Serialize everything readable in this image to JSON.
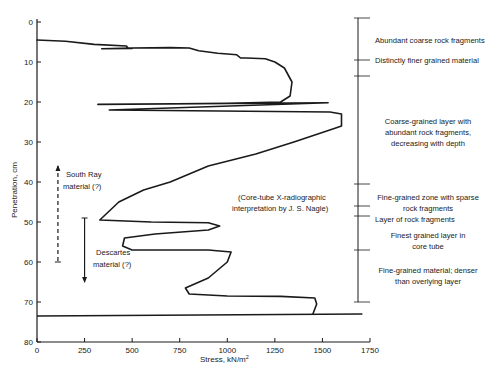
{
  "chart_data": {
    "type": "line",
    "title": "",
    "xlabel": "Stress, kN/m²",
    "ylabel": "Penetration, cm",
    "xlim": [
      0,
      1750
    ],
    "ylim": [
      80,
      0
    ],
    "y_inverted": true,
    "grid": false,
    "x_ticks": [
      0,
      250,
      500,
      750,
      1000,
      1250,
      1500,
      1750
    ],
    "y_ticks": [
      0,
      10,
      20,
      30,
      40,
      50,
      60,
      70,
      80
    ],
    "series": [
      {
        "name": "Penetration resistance trace",
        "points": [
          [
            0,
            4.5
          ],
          [
            150,
            4.8
          ],
          [
            300,
            5.6
          ],
          [
            470,
            6.0
          ],
          [
            480,
            6.6
          ],
          [
            500,
            6.6
          ],
          [
            340,
            6.7
          ],
          [
            500,
            6.5
          ],
          [
            700,
            6.4
          ],
          [
            800,
            6.5
          ],
          [
            850,
            7.2
          ],
          [
            950,
            7.8
          ],
          [
            1050,
            8.2
          ],
          [
            1070,
            9.0
          ],
          [
            1100,
            9.0
          ],
          [
            1200,
            9.2
          ],
          [
            1250,
            10.0
          ],
          [
            1300,
            11.5
          ],
          [
            1340,
            15.0
          ],
          [
            1330,
            18.5
          ],
          [
            1280,
            20.0
          ],
          [
            1000,
            20.3
          ],
          [
            600,
            20.5
          ],
          [
            320,
            20.6
          ],
          [
            1530,
            20.2
          ],
          [
            380,
            22.0
          ],
          [
            1540,
            22.5
          ],
          [
            1600,
            23.0
          ],
          [
            1600,
            26.0
          ],
          [
            1570,
            26.5
          ],
          [
            1350,
            30.0
          ],
          [
            1150,
            33.0
          ],
          [
            900,
            36.0
          ],
          [
            700,
            40.0
          ],
          [
            560,
            42.0
          ],
          [
            430,
            45.0
          ],
          [
            330,
            49.5
          ],
          [
            600,
            50.0
          ],
          [
            900,
            50.2
          ],
          [
            960,
            51.0
          ],
          [
            900,
            52.0
          ],
          [
            620,
            53.0
          ],
          [
            460,
            54.0
          ],
          [
            450,
            56.0
          ],
          [
            500,
            57.0
          ],
          [
            650,
            57.0
          ],
          [
            900,
            57.0
          ],
          [
            1020,
            57.5
          ],
          [
            1000,
            60.0
          ],
          [
            900,
            64.0
          ],
          [
            780,
            66.5
          ],
          [
            800,
            68.0
          ],
          [
            1000,
            68.5
          ],
          [
            1280,
            68.6
          ],
          [
            1460,
            69.0
          ],
          [
            1470,
            70.5
          ],
          [
            1450,
            73.0
          ]
        ]
      }
    ],
    "reference_lines": [
      {
        "name": "bottom-of-core",
        "x1": 0,
        "x2": 1710,
        "y1": 73.5,
        "y2": 73.0
      }
    ],
    "annotations": [
      {
        "text": "South Ray",
        "x": 280,
        "y": 40
      },
      {
        "text": "material (?)",
        "x": 280,
        "y": 43
      },
      {
        "text": "Descartes",
        "x": 430,
        "y": 56
      },
      {
        "text": "material (?)",
        "x": 430,
        "y": 59
      },
      {
        "text": "(Core-tube X-radiographic",
        "x": 1260,
        "y": 45
      },
      {
        "text": "interpretation by  J. S. Nagle)",
        "x": 1260,
        "y": 48
      }
    ],
    "range_markers": [
      {
        "label": "South Ray material (?)",
        "x": 110,
        "from": 36,
        "to": 60,
        "style": "dashed",
        "arrow": "up"
      },
      {
        "label": "Descartes material (?)",
        "x": 250,
        "from": 49,
        "to": 65,
        "style": "solid",
        "arrow": "down"
      }
    ],
    "strata_column": {
      "boundaries_cm": [
        -1,
        9.5,
        13.5,
        40.5,
        46,
        48.5,
        57,
        70
      ],
      "units": [
        {
          "label": "Abundant coarse rock fragments",
          "from": -1,
          "to": 9.5
        },
        {
          "label": "Distinctly finer grained material",
          "from": 9.5,
          "to": 13.5
        },
        {
          "label": "Coarse-grained layer  with abundant rock fragments, decreasing with depth",
          "from": 13.5,
          "to": 40.5
        },
        {
          "label": "Fine-grained zone with sparse rock fragments",
          "from": 40.5,
          "to": 46
        },
        {
          "label": "Layer of rock fragments",
          "from": 46,
          "to": 48.5
        },
        {
          "label": "Finest grained layer in core tube",
          "from": 48.5,
          "to": 57
        },
        {
          "label": "Fine-grained material; denser than overlying layer",
          "from": 57,
          "to": 70
        }
      ]
    }
  },
  "labels": {
    "xlabel": "Stress, kN/m",
    "xlabel_sup": "2",
    "ylabel": "Penetration, cm",
    "south_ray_1": "South Ray",
    "south_ray_2": "material (?)",
    "descartes_1": "Descartes",
    "descartes_2": "material (?)",
    "nagle_1": "(Core-tube X-radiographic",
    "nagle_2": "interpretation by  J. S. Nagle)",
    "strata": [
      [
        "Abundant coarse rock fragments"
      ],
      [
        "Distinctly finer grained material"
      ],
      [
        "Coarse-grained layer  with",
        "abundant rock fragments,",
        "decreasing with depth"
      ],
      [
        "Fine-grained zone with  sparse",
        "rock fragments"
      ],
      [
        "Layer of rock fragments"
      ],
      [
        "Finest grained layer in",
        "core tube"
      ],
      [
        "Fine-grained material;  denser",
        "than overlying layer"
      ]
    ]
  },
  "colors": {
    "ink": "#1a1a1a",
    "background": "#ffffff"
  }
}
